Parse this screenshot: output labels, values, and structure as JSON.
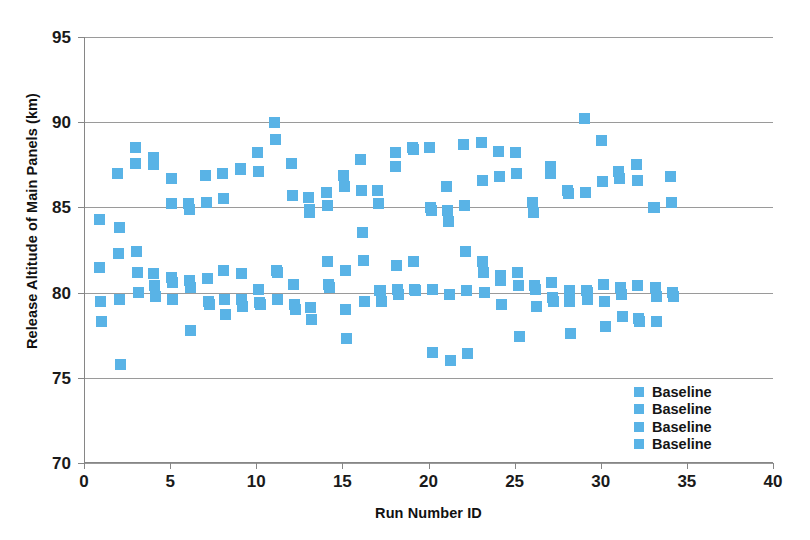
{
  "chart_data": {
    "type": "scatter",
    "title": "",
    "xlabel": "Run Number ID",
    "ylabel": "Release Altitude of Main Panels (km)",
    "xlim": [
      0,
      40
    ],
    "ylim": [
      70,
      95
    ],
    "xticks": [
      0,
      5,
      10,
      15,
      20,
      25,
      30,
      35,
      40
    ],
    "yticks": [
      70,
      75,
      80,
      85,
      90,
      95
    ],
    "grid": "horizontal",
    "legend_position": "inside-lower-right",
    "marker_color": "#59B3E6",
    "marker_shape": "square",
    "legend": [
      {
        "label": "Baseline",
        "color": "#59B3E6"
      },
      {
        "label": "Baseline",
        "color": "#59B3E6"
      },
      {
        "label": "Baseline",
        "color": "#59B3E6"
      },
      {
        "label": "Baseline",
        "color": "#59B3E6"
      }
    ],
    "series": [
      {
        "name": "Baseline",
        "points": [
          [
            0.85,
            84.3
          ],
          [
            0.85,
            81.5
          ],
          [
            0.9,
            79.5
          ],
          [
            0.95,
            78.3
          ],
          [
            1.9,
            87.0
          ],
          [
            2.0,
            83.8
          ],
          [
            1.95,
            82.3
          ],
          [
            2.0,
            79.6
          ],
          [
            2.05,
            75.8
          ],
          [
            2.95,
            88.5
          ],
          [
            2.95,
            87.6
          ],
          [
            3.0,
            82.4
          ],
          [
            3.05,
            81.2
          ],
          [
            3.1,
            80.0
          ],
          [
            3.95,
            87.9
          ],
          [
            4.0,
            87.5
          ],
          [
            4.0,
            81.1
          ],
          [
            4.05,
            80.4
          ],
          [
            4.1,
            79.8
          ],
          [
            5.0,
            86.7
          ],
          [
            5.05,
            85.2
          ],
          [
            5.05,
            80.9
          ],
          [
            5.1,
            80.6
          ],
          [
            5.1,
            79.6
          ],
          [
            6.0,
            85.2
          ],
          [
            6.05,
            84.9
          ],
          [
            6.05,
            80.7
          ],
          [
            6.1,
            80.3
          ],
          [
            6.15,
            77.8
          ],
          [
            7.0,
            86.9
          ],
          [
            7.05,
            85.3
          ],
          [
            7.1,
            80.8
          ],
          [
            7.15,
            79.5
          ],
          [
            7.2,
            79.3
          ],
          [
            8.0,
            87.0
          ],
          [
            8.05,
            85.5
          ],
          [
            8.05,
            81.3
          ],
          [
            8.1,
            79.6
          ],
          [
            8.15,
            78.7
          ],
          [
            9.0,
            87.3
          ],
          [
            9.05,
            87.2
          ],
          [
            9.1,
            81.1
          ],
          [
            9.1,
            79.6
          ],
          [
            9.15,
            79.2
          ],
          [
            10.0,
            88.2
          ],
          [
            10.05,
            87.1
          ],
          [
            10.1,
            80.2
          ],
          [
            10.15,
            79.4
          ],
          [
            10.2,
            79.3
          ],
          [
            11.0,
            90.0
          ],
          [
            11.05,
            89.0
          ],
          [
            11.1,
            81.3
          ],
          [
            11.15,
            81.2
          ],
          [
            11.2,
            79.6
          ],
          [
            12.0,
            87.6
          ],
          [
            12.05,
            85.7
          ],
          [
            12.1,
            80.5
          ],
          [
            12.15,
            79.3
          ],
          [
            12.2,
            79.0
          ],
          [
            13.0,
            85.6
          ],
          [
            13.05,
            84.9
          ],
          [
            13.05,
            84.7
          ],
          [
            13.1,
            79.1
          ],
          [
            13.15,
            78.4
          ],
          [
            14.0,
            85.9
          ],
          [
            14.05,
            85.1
          ],
          [
            14.1,
            81.8
          ],
          [
            14.15,
            80.5
          ],
          [
            14.2,
            80.3
          ],
          [
            15.0,
            86.9
          ],
          [
            15.05,
            86.2
          ],
          [
            15.1,
            81.3
          ],
          [
            15.15,
            79.0
          ],
          [
            15.2,
            77.3
          ],
          [
            16.0,
            87.8
          ],
          [
            16.05,
            86.0
          ],
          [
            16.1,
            83.5
          ],
          [
            16.15,
            81.9
          ],
          [
            16.2,
            79.5
          ],
          [
            17.0,
            86.0
          ],
          [
            17.05,
            85.2
          ],
          [
            17.1,
            80.1
          ],
          [
            17.15,
            80.1
          ],
          [
            17.2,
            79.5
          ],
          [
            18.0,
            88.2
          ],
          [
            18.05,
            87.4
          ],
          [
            18.1,
            81.6
          ],
          [
            18.15,
            80.2
          ],
          [
            18.2,
            79.9
          ],
          [
            19.0,
            88.5
          ],
          [
            19.05,
            88.4
          ],
          [
            19.1,
            81.8
          ],
          [
            19.15,
            80.2
          ],
          [
            19.2,
            80.1
          ],
          [
            20.0,
            88.5
          ],
          [
            20.05,
            85.0
          ],
          [
            20.1,
            84.8
          ],
          [
            20.15,
            80.2
          ],
          [
            20.2,
            76.5
          ],
          [
            21.0,
            86.2
          ],
          [
            21.05,
            84.8
          ],
          [
            21.1,
            84.2
          ],
          [
            21.15,
            79.9
          ],
          [
            21.2,
            76.0
          ],
          [
            22.0,
            88.7
          ],
          [
            22.05,
            85.1
          ],
          [
            22.1,
            82.4
          ],
          [
            22.15,
            80.1
          ],
          [
            22.2,
            76.4
          ],
          [
            23.0,
            88.8
          ],
          [
            23.05,
            86.6
          ],
          [
            23.1,
            81.8
          ],
          [
            23.15,
            81.2
          ],
          [
            23.2,
            80.0
          ],
          [
            24.0,
            88.3
          ],
          [
            24.05,
            86.8
          ],
          [
            24.1,
            81.0
          ],
          [
            24.15,
            80.7
          ],
          [
            24.2,
            79.3
          ],
          [
            25.0,
            88.2
          ],
          [
            25.05,
            87.0
          ],
          [
            25.1,
            81.2
          ],
          [
            25.15,
            80.4
          ],
          [
            25.2,
            77.4
          ],
          [
            26.0,
            85.3
          ],
          [
            26.05,
            84.7
          ],
          [
            26.1,
            80.4
          ],
          [
            26.15,
            80.2
          ],
          [
            26.2,
            79.2
          ],
          [
            27.0,
            87.4
          ],
          [
            27.05,
            87.0
          ],
          [
            27.1,
            80.6
          ],
          [
            27.15,
            79.7
          ],
          [
            27.2,
            79.5
          ],
          [
            28.0,
            86.0
          ],
          [
            28.05,
            85.8
          ],
          [
            28.1,
            80.1
          ],
          [
            28.15,
            79.5
          ],
          [
            28.2,
            77.6
          ],
          [
            29.0,
            90.2
          ],
          [
            29.05,
            85.9
          ],
          [
            29.1,
            80.1
          ],
          [
            29.15,
            80.0
          ],
          [
            29.2,
            79.6
          ],
          [
            30.0,
            88.9
          ],
          [
            30.05,
            86.5
          ],
          [
            30.1,
            80.5
          ],
          [
            30.15,
            79.5
          ],
          [
            30.2,
            78.0
          ],
          [
            31.0,
            87.1
          ],
          [
            31.05,
            86.7
          ],
          [
            31.1,
            80.3
          ],
          [
            31.15,
            79.9
          ],
          [
            31.2,
            78.6
          ],
          [
            32.0,
            87.5
          ],
          [
            32.05,
            86.6
          ],
          [
            32.1,
            80.4
          ],
          [
            32.15,
            78.5
          ],
          [
            32.2,
            78.3
          ],
          [
            33.0,
            85.0
          ],
          [
            33.05,
            85.0
          ],
          [
            33.1,
            80.3
          ],
          [
            33.15,
            79.8
          ],
          [
            33.2,
            78.3
          ],
          [
            34.0,
            86.8
          ],
          [
            34.05,
            85.3
          ],
          [
            34.1,
            80.0
          ],
          [
            34.15,
            79.8
          ]
        ]
      }
    ]
  }
}
